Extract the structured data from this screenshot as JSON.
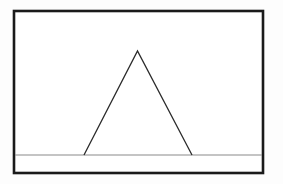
{
  "figure": {
    "canvas": {
      "width": 283,
      "height": 184,
      "background_color": "#fdfdfd",
      "interior_color": "#ffffff"
    },
    "frame": {
      "name": "rectangular-border",
      "x": 14,
      "y": 11,
      "width": 249,
      "height": 162,
      "stroke_color": "#1a1a1a",
      "stroke_width": 2.6,
      "fill": "none"
    },
    "ground_line": {
      "name": "horizontal-ground-line",
      "x1": 15,
      "y1": 155,
      "x2": 262,
      "y2": 155,
      "stroke_color": "#8a8a8a",
      "stroke_width": 1.2
    },
    "triangle": {
      "name": "isosceles-triangle",
      "apex": {
        "x": 137.5,
        "y": 51
      },
      "base_left": {
        "x": 84,
        "y": 155
      },
      "base_right": {
        "x": 192,
        "y": 155
      },
      "points": "137.5,51 192,155 84,155",
      "stroke_color": "#2b2b2b",
      "stroke_width": 1.3,
      "fill": "none",
      "base_width": 108,
      "height": 104,
      "closed_base": false
    }
  }
}
